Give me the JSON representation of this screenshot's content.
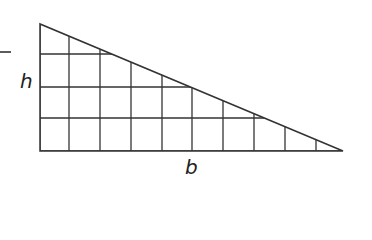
{
  "diagram": {
    "shape": "right-triangle",
    "labels": {
      "height": "h",
      "base": "b"
    },
    "colors": {
      "stroke": "#333333",
      "background": "#ffffff",
      "text": "#222222"
    },
    "grid": {
      "columns": 10,
      "rows": 4,
      "x_lines": [
        40,
        69,
        100,
        131,
        162,
        192,
        223,
        254,
        285,
        316
      ],
      "y_lines": [
        24,
        54,
        87,
        118,
        151
      ]
    },
    "triangle": {
      "right_angle_vertex": [
        40,
        151
      ],
      "top_vertex": [
        40,
        24
      ],
      "base_vertex": [
        343,
        151
      ]
    },
    "side_mark": {
      "description": "short dash at left edge",
      "x1": 0,
      "x2": 11,
      "y": 52
    }
  }
}
